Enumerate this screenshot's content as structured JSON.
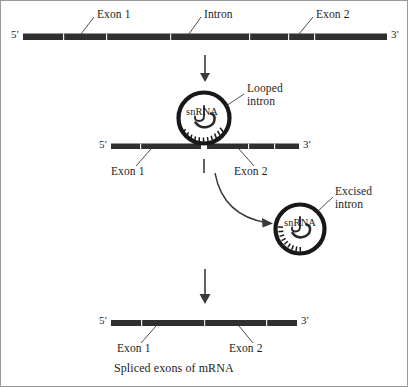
{
  "figure": {
    "caption": "Spliced exons of mRNA",
    "background_color": "#ffffff",
    "stroke_color": "#1d1d1d",
    "strand_color": "#2b2b2b"
  },
  "stage1": {
    "name": "pre-mRNA strand",
    "five_prime": "5'",
    "three_prime": "3'",
    "labels": {
      "exon1": "Exon 1",
      "intron": "Intron",
      "exon2": "Exon 2"
    }
  },
  "stage2": {
    "name": "looped intron bound by snRNA",
    "five_prime": "5'",
    "three_prime": "3'",
    "snrna": "snRNA",
    "looped_intron": "Looped\nintron",
    "labels": {
      "exon1": "Exon 1",
      "exon2": "Exon 2"
    }
  },
  "stage3": {
    "name": "excised intron lariat",
    "snrna": "snRNA",
    "excised_intron": "Excised\nintron"
  },
  "stage4": {
    "name": "spliced mRNA strand",
    "five_prime": "5'",
    "three_prime": "3'",
    "labels": {
      "exon1": "Exon 1",
      "exon2": "Exon 2"
    }
  }
}
